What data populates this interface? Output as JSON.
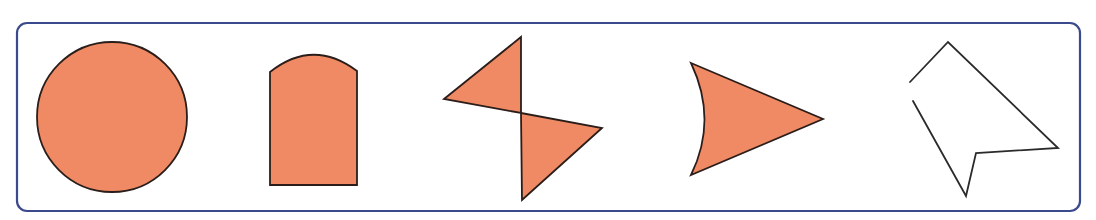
{
  "figure": {
    "colors": {
      "fill": "#f08a64",
      "stroke": "#2b1e1a",
      "frame": "#3b4a8c",
      "background": "#ffffff"
    },
    "frame": {
      "x": 17,
      "y": 23,
      "width": 1063,
      "height": 188,
      "radius": 10
    },
    "shapes": [
      {
        "id": 1,
        "name": "circle",
        "filled": true,
        "closed": true,
        "cx": 112,
        "cy": 117,
        "r": 75
      },
      {
        "id": 2,
        "name": "rectangle-with-arched-top",
        "filled": true,
        "closed": true,
        "curved_side": true
      },
      {
        "id": 3,
        "name": "two-triangles-joined-at-vertex (bow-tie)",
        "filled": true,
        "closed": true
      },
      {
        "id": 4,
        "name": "triangle-with-concave-curved-side",
        "filled": true,
        "closed": true,
        "curved_side": true
      },
      {
        "id": 5,
        "name": "open-polygon (not closed)",
        "filled": false,
        "closed": false
      }
    ]
  }
}
